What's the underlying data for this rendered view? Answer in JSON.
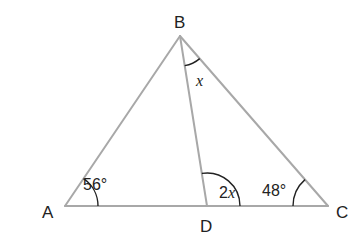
{
  "diagram": {
    "type": "triangle",
    "colors": {
      "edge": "#a8a8a8",
      "arc": "#222222",
      "text": "#222222",
      "background": "#ffffff"
    },
    "vertices": {
      "A": {
        "label": "A",
        "x": 65,
        "y": 206
      },
      "B": {
        "label": "B",
        "x": 180,
        "y": 36
      },
      "C": {
        "label": "C",
        "x": 328,
        "y": 206
      },
      "D": {
        "label": "D",
        "x": 207,
        "y": 206
      }
    },
    "segments": [
      "AB",
      "BC",
      "AC",
      "BD"
    ],
    "angles": {
      "A": {
        "vertex": "A",
        "value": "56°"
      },
      "ABD": {
        "vertex": "B",
        "value": "x"
      },
      "BDC": {
        "vertex": "D",
        "value_prefix": "2",
        "value_var": "x"
      },
      "C": {
        "vertex": "C",
        "value": "48°"
      }
    }
  }
}
